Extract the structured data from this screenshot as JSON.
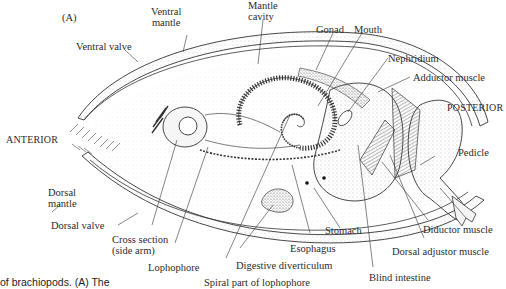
{
  "figure": {
    "panel_letter": "(A)",
    "caption_fragment": "of brachiopods. (A) The",
    "orientation": {
      "anterior": "ANTERIOR",
      "posterior": "POSTERIOR"
    },
    "labels": {
      "ventral_mantle": [
        "Ventral",
        "mantle"
      ],
      "mantle_cavity": [
        "Mantle",
        "cavity"
      ],
      "gonad": "Gonad",
      "mouth": "Mouth",
      "nephridium": "Nephridium",
      "adductor_muscle": "Adductor muscle",
      "ventral_valve": "Ventral valve",
      "pedicle": "Pedicle",
      "dorsal_mantle": [
        "Dorsal",
        "mantle"
      ],
      "dorsal_valve": "Dorsal valve",
      "cross_section": [
        "Cross section",
        "(side arm)"
      ],
      "lophophore": "Lophophore",
      "spiral_part": "Spiral part of lophophore",
      "digestive_diverticulum": "Digestive diverticulum",
      "esophagus": "Esophagus",
      "stomach": "Stomach",
      "blind_intestine": "Blind intestine",
      "diductor_muscle": "Diductor muscle",
      "dorsal_adjustor_muscle": "Dorsal adjustor muscle"
    },
    "colors": {
      "ink": "#2b2b2b",
      "stipple": "#bdbdbd",
      "background": "#ffffff"
    }
  }
}
